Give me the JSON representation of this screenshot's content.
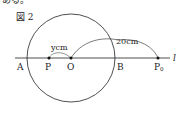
{
  "header_fragment": "ある。",
  "figure": {
    "title": "図 2",
    "points": {
      "A": "A",
      "P": "P",
      "O": "O",
      "B": "B",
      "P0": "P",
      "P0_sub": "0"
    },
    "line_label": "l",
    "distance_labels": {
      "y": "ycm",
      "twenty": "20cm"
    },
    "colors": {
      "stroke": "#222222",
      "background": "#ffffff"
    }
  }
}
